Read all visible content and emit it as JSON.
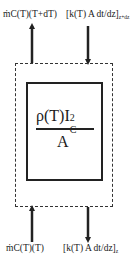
{
  "top": {
    "advection_label": "ṁC(T)(T+dT)",
    "conduction_label": "[k(T) A dt/dz]",
    "conduction_subscript": "z+dz"
  },
  "bottom": {
    "advection_label": "ṁC(T)(T)",
    "conduction_label": "[k(T) A dt/dz]",
    "conduction_subscript": "z"
  },
  "source_term": {
    "numerator_base": "ρ(T)I",
    "superscript": "2",
    "subscript": "C",
    "denominator": "A"
  },
  "colors": {
    "line": "#222222",
    "background": "#ffffff"
  }
}
